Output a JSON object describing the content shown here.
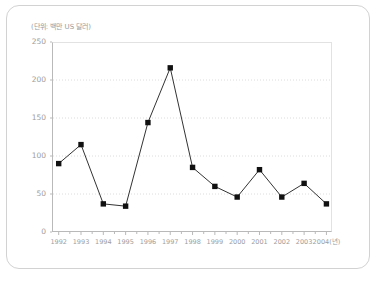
{
  "chart_data": {
    "type": "line",
    "title": "",
    "subtitle": "",
    "unit_label": "(단위: 백만 US 달러)",
    "xlabel": "(년)",
    "ylabel": "",
    "categories": [
      "1992",
      "1993",
      "1994",
      "1995",
      "1996",
      "1997",
      "1998",
      "1999",
      "2000",
      "2001",
      "2002",
      "2003",
      "2004"
    ],
    "x_tick_labels": [
      "1992",
      "1993",
      "1994",
      "1995",
      "1996",
      "1997",
      "1998",
      "1999",
      "2000",
      "2001",
      "2002",
      "2003",
      "2004(년)"
    ],
    "values": [
      90,
      115,
      37,
      34,
      144,
      216,
      85,
      60,
      46,
      82,
      46,
      64,
      37
    ],
    "ylim": [
      0,
      250
    ],
    "y_ticks": [
      0,
      50,
      100,
      150,
      200,
      250
    ],
    "y_tick_labels": [
      "0",
      "50",
      "100",
      "150",
      "200",
      "250"
    ],
    "grid": "horizontal-dotted",
    "legend": "none",
    "series": [
      {
        "name": "",
        "marker": "square",
        "color": "#1a1a1a",
        "values": [
          90,
          115,
          37,
          34,
          144,
          216,
          85,
          60,
          46,
          82,
          46,
          64,
          37
        ]
      }
    ]
  },
  "colors": {
    "line": "#333333",
    "marker": "#111111",
    "grid": "#dcdcdc",
    "axis": "#b9b9b9",
    "frame_light": "#e2e2e2",
    "tick_text": "#9d9d9d",
    "unit_text": "#9a9a9a",
    "card_border": "#d2d2d2",
    "background": "#ffffff"
  }
}
